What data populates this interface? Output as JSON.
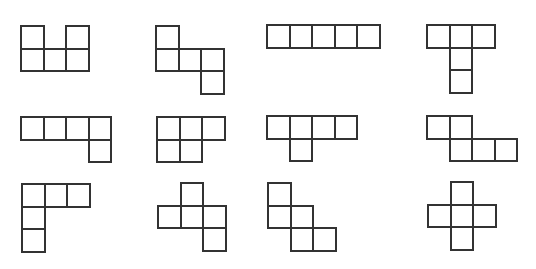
{
  "figure": {
    "title": "",
    "cell_size": 22.5,
    "line_color": "#333333",
    "background": "#ffffff",
    "shapes": [
      {
        "name": "U-pentomino",
        "x": 20,
        "y": 25,
        "cells": [
          [
            0,
            0
          ],
          [
            2,
            0
          ],
          [
            0,
            1
          ],
          [
            1,
            1
          ],
          [
            2,
            1
          ]
        ]
      },
      {
        "name": "S-step-pentomino",
        "x": 155,
        "y": 25,
        "cells": [
          [
            0,
            0
          ],
          [
            0,
            1
          ],
          [
            1,
            1
          ],
          [
            2,
            1
          ],
          [
            2,
            2
          ]
        ]
      },
      {
        "name": "I-pentomino",
        "x": 266,
        "y": 24,
        "cells": [
          [
            0,
            0
          ],
          [
            1,
            0
          ],
          [
            2,
            0
          ],
          [
            3,
            0
          ],
          [
            4,
            0
          ]
        ]
      },
      {
        "name": "T-pentomino",
        "x": 426,
        "y": 24,
        "cells": [
          [
            0,
            0
          ],
          [
            1,
            0
          ],
          [
            2,
            0
          ],
          [
            1,
            1
          ],
          [
            1,
            2
          ]
        ]
      },
      {
        "name": "L-pentomino",
        "x": 20,
        "y": 116,
        "cells": [
          [
            0,
            0
          ],
          [
            1,
            0
          ],
          [
            2,
            0
          ],
          [
            3,
            0
          ],
          [
            3,
            1
          ]
        ]
      },
      {
        "name": "P-pentomino",
        "x": 156,
        "y": 116,
        "cells": [
          [
            0,
            0
          ],
          [
            1,
            0
          ],
          [
            2,
            0
          ],
          [
            0,
            1
          ],
          [
            1,
            1
          ]
        ]
      },
      {
        "name": "Y-pentomino",
        "x": 266,
        "y": 115,
        "cells": [
          [
            0,
            0
          ],
          [
            1,
            0
          ],
          [
            2,
            0
          ],
          [
            3,
            0
          ],
          [
            1,
            1
          ]
        ]
      },
      {
        "name": "N-pentomino",
        "x": 426,
        "y": 115,
        "cells": [
          [
            0,
            0
          ],
          [
            1,
            0
          ],
          [
            1,
            1
          ],
          [
            2,
            1
          ],
          [
            3,
            1
          ]
        ]
      },
      {
        "name": "V-pentomino",
        "x": 21,
        "y": 183,
        "cells": [
          [
            0,
            0
          ],
          [
            1,
            0
          ],
          [
            2,
            0
          ],
          [
            0,
            1
          ],
          [
            0,
            2
          ]
        ]
      },
      {
        "name": "F-pentomino",
        "x": 157,
        "y": 182,
        "cells": [
          [
            1,
            0
          ],
          [
            0,
            1
          ],
          [
            1,
            1
          ],
          [
            2,
            1
          ],
          [
            2,
            2
          ]
        ]
      },
      {
        "name": "W-pentomino",
        "x": 267,
        "y": 182,
        "cells": [
          [
            0,
            0
          ],
          [
            0,
            1
          ],
          [
            1,
            1
          ],
          [
            1,
            2
          ],
          [
            2,
            2
          ]
        ]
      },
      {
        "name": "X-pentomino",
        "x": 427,
        "y": 181,
        "cells": [
          [
            1,
            0
          ],
          [
            0,
            1
          ],
          [
            1,
            1
          ],
          [
            2,
            1
          ],
          [
            1,
            2
          ]
        ]
      }
    ]
  }
}
